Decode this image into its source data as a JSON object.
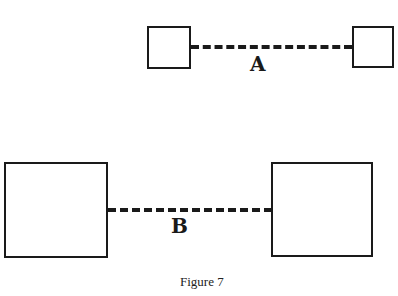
{
  "figure": {
    "caption": "Figure 7",
    "pairs": [
      {
        "label": "A",
        "box_size": "small"
      },
      {
        "label": "B",
        "box_size": "large"
      }
    ]
  }
}
